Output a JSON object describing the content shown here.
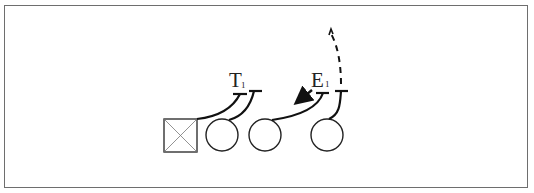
{
  "diagram": {
    "type": "football-play",
    "players": [
      {
        "id": "center",
        "shape": "square-x",
        "x": 181,
        "y": 135
      },
      {
        "id": "lineman-1",
        "shape": "circle",
        "x": 222,
        "y": 135
      },
      {
        "id": "lineman-2",
        "shape": "circle",
        "x": 265,
        "y": 135
      },
      {
        "id": "lineman-3",
        "shape": "circle",
        "x": 327,
        "y": 135
      }
    ],
    "labels": [
      {
        "id": "tackle",
        "text": "T",
        "sub": "1",
        "x": 231,
        "y": 87
      },
      {
        "id": "end",
        "text": "E",
        "sub": "1",
        "x": 313,
        "y": 87
      }
    ],
    "colors": {
      "line": "#111111",
      "frame": "#6e6e6e",
      "background": "#ffffff"
    }
  }
}
